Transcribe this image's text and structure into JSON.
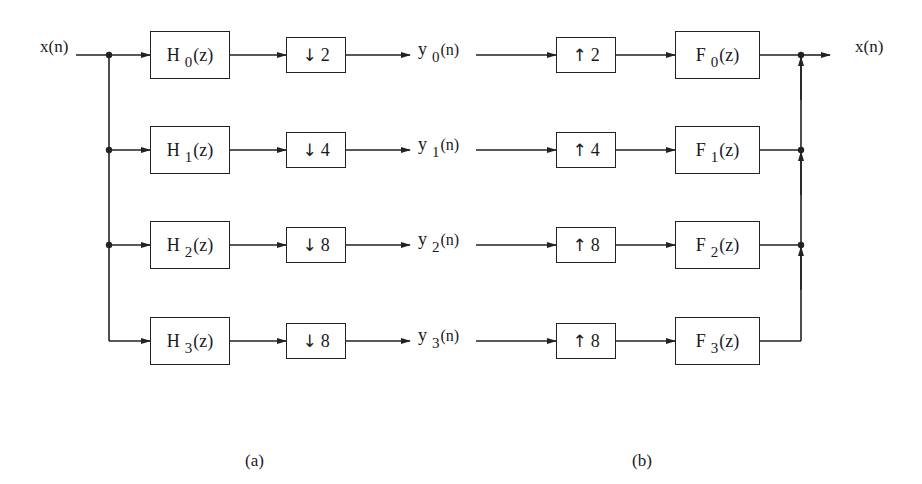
{
  "input_label": "x(n)",
  "output_label": "x(n)",
  "channels": [
    {
      "analysis": {
        "name": "H",
        "sub": "0",
        "arg": "(z)"
      },
      "down": "2",
      "signal": {
        "name": "y",
        "sub": "0",
        "arg": "(n)"
      },
      "up": "2",
      "synthesis": {
        "name": "F",
        "sub": "0",
        "arg": "(z)"
      }
    },
    {
      "analysis": {
        "name": "H",
        "sub": "1",
        "arg": "(z)"
      },
      "down": "4",
      "signal": {
        "name": "y",
        "sub": "1",
        "arg": "(n)"
      },
      "up": "4",
      "synthesis": {
        "name": "F",
        "sub": "1",
        "arg": "(z)"
      }
    },
    {
      "analysis": {
        "name": "H",
        "sub": "2",
        "arg": "(z)"
      },
      "down": "8",
      "signal": {
        "name": "y",
        "sub": "2",
        "arg": "(n)"
      },
      "up": "8",
      "synthesis": {
        "name": "F",
        "sub": "2",
        "arg": "(z)"
      }
    },
    {
      "analysis": {
        "name": "H",
        "sub": "3",
        "arg": "(z)"
      },
      "down": "8",
      "signal": {
        "name": "y",
        "sub": "3",
        "arg": "(n)"
      },
      "up": "8",
      "synthesis": {
        "name": "F",
        "sub": "3",
        "arg": "(z)"
      }
    }
  ],
  "icons": {
    "down": "↓",
    "up": "↑"
  },
  "captions": {
    "a": "(a)",
    "b": "(b)"
  }
}
